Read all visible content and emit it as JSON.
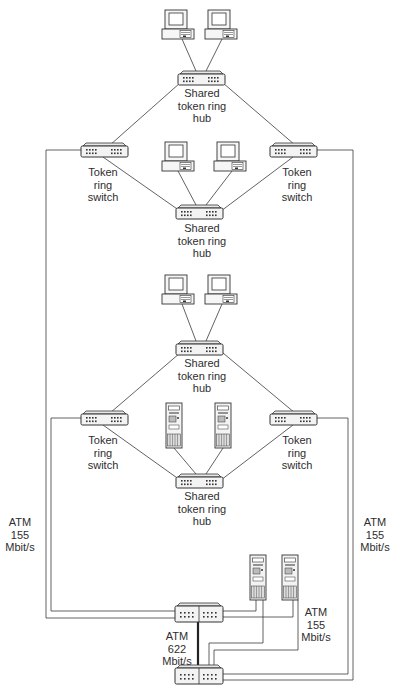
{
  "colors": {
    "line": "#3a3a3a",
    "device_fill": "#f4f4f4",
    "device_stroke": "#333333",
    "background": "#ffffff"
  },
  "labels": {
    "hub_top_1": "Shared\ntoken ring\nhub",
    "switch_left_1": "Token\nring\nswitch",
    "switch_right_1": "Token\nring\nswitch",
    "hub_bottom_1": "Shared\ntoken ring\nhub",
    "hub_top_2": "Shared\ntoken ring\nhub",
    "switch_left_2": "Token\nring\nswitch",
    "switch_right_2": "Token\nring\nswitch",
    "hub_bottom_2": "Shared\ntoken ring\nhub",
    "atm_left": "ATM\n155\nMbit/s",
    "atm_right": "ATM\n155\nMbit/s",
    "atm_servers": "ATM\n155\nMbit/s",
    "atm_backbone": "ATM\n622\nMbit/s"
  },
  "nodes": {
    "pcs": [
      {
        "id": "pc1",
        "x": 162,
        "y": 10
      },
      {
        "id": "pc2",
        "x": 205,
        "y": 10
      },
      {
        "id": "pc3",
        "x": 162,
        "y": 142
      },
      {
        "id": "pc4",
        "x": 214,
        "y": 142
      },
      {
        "id": "pc5",
        "x": 162,
        "y": 275
      },
      {
        "id": "pc6",
        "x": 205,
        "y": 275
      }
    ],
    "servers": [
      {
        "id": "srv1",
        "x": 166,
        "y": 403
      },
      {
        "id": "srv2",
        "x": 215,
        "y": 403
      },
      {
        "id": "srv3",
        "x": 250,
        "y": 555
      },
      {
        "id": "srv4",
        "x": 282,
        "y": 555
      }
    ],
    "hubs": [
      {
        "id": "hub1",
        "x": 178,
        "y": 71
      },
      {
        "id": "sw1",
        "x": 81,
        "y": 143
      },
      {
        "id": "sw2",
        "x": 270,
        "y": 143
      },
      {
        "id": "hub2",
        "x": 176,
        "y": 205
      },
      {
        "id": "hub3",
        "x": 176,
        "y": 341
      },
      {
        "id": "sw3",
        "x": 81,
        "y": 411
      },
      {
        "id": "sw4",
        "x": 270,
        "y": 411
      },
      {
        "id": "hub4",
        "x": 176,
        "y": 474
      }
    ],
    "atm_switches": [
      {
        "id": "atm1",
        "x": 175,
        "y": 603
      },
      {
        "id": "atm2",
        "x": 175,
        "y": 665
      }
    ]
  }
}
